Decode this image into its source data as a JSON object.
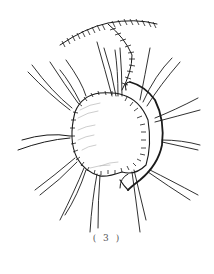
{
  "figure": {
    "caption": "( 3 )",
    "colors": {
      "ink": "#1a1a1a",
      "shading": "#b8b8b8",
      "caption": "#555555",
      "background": "#ffffff"
    }
  }
}
